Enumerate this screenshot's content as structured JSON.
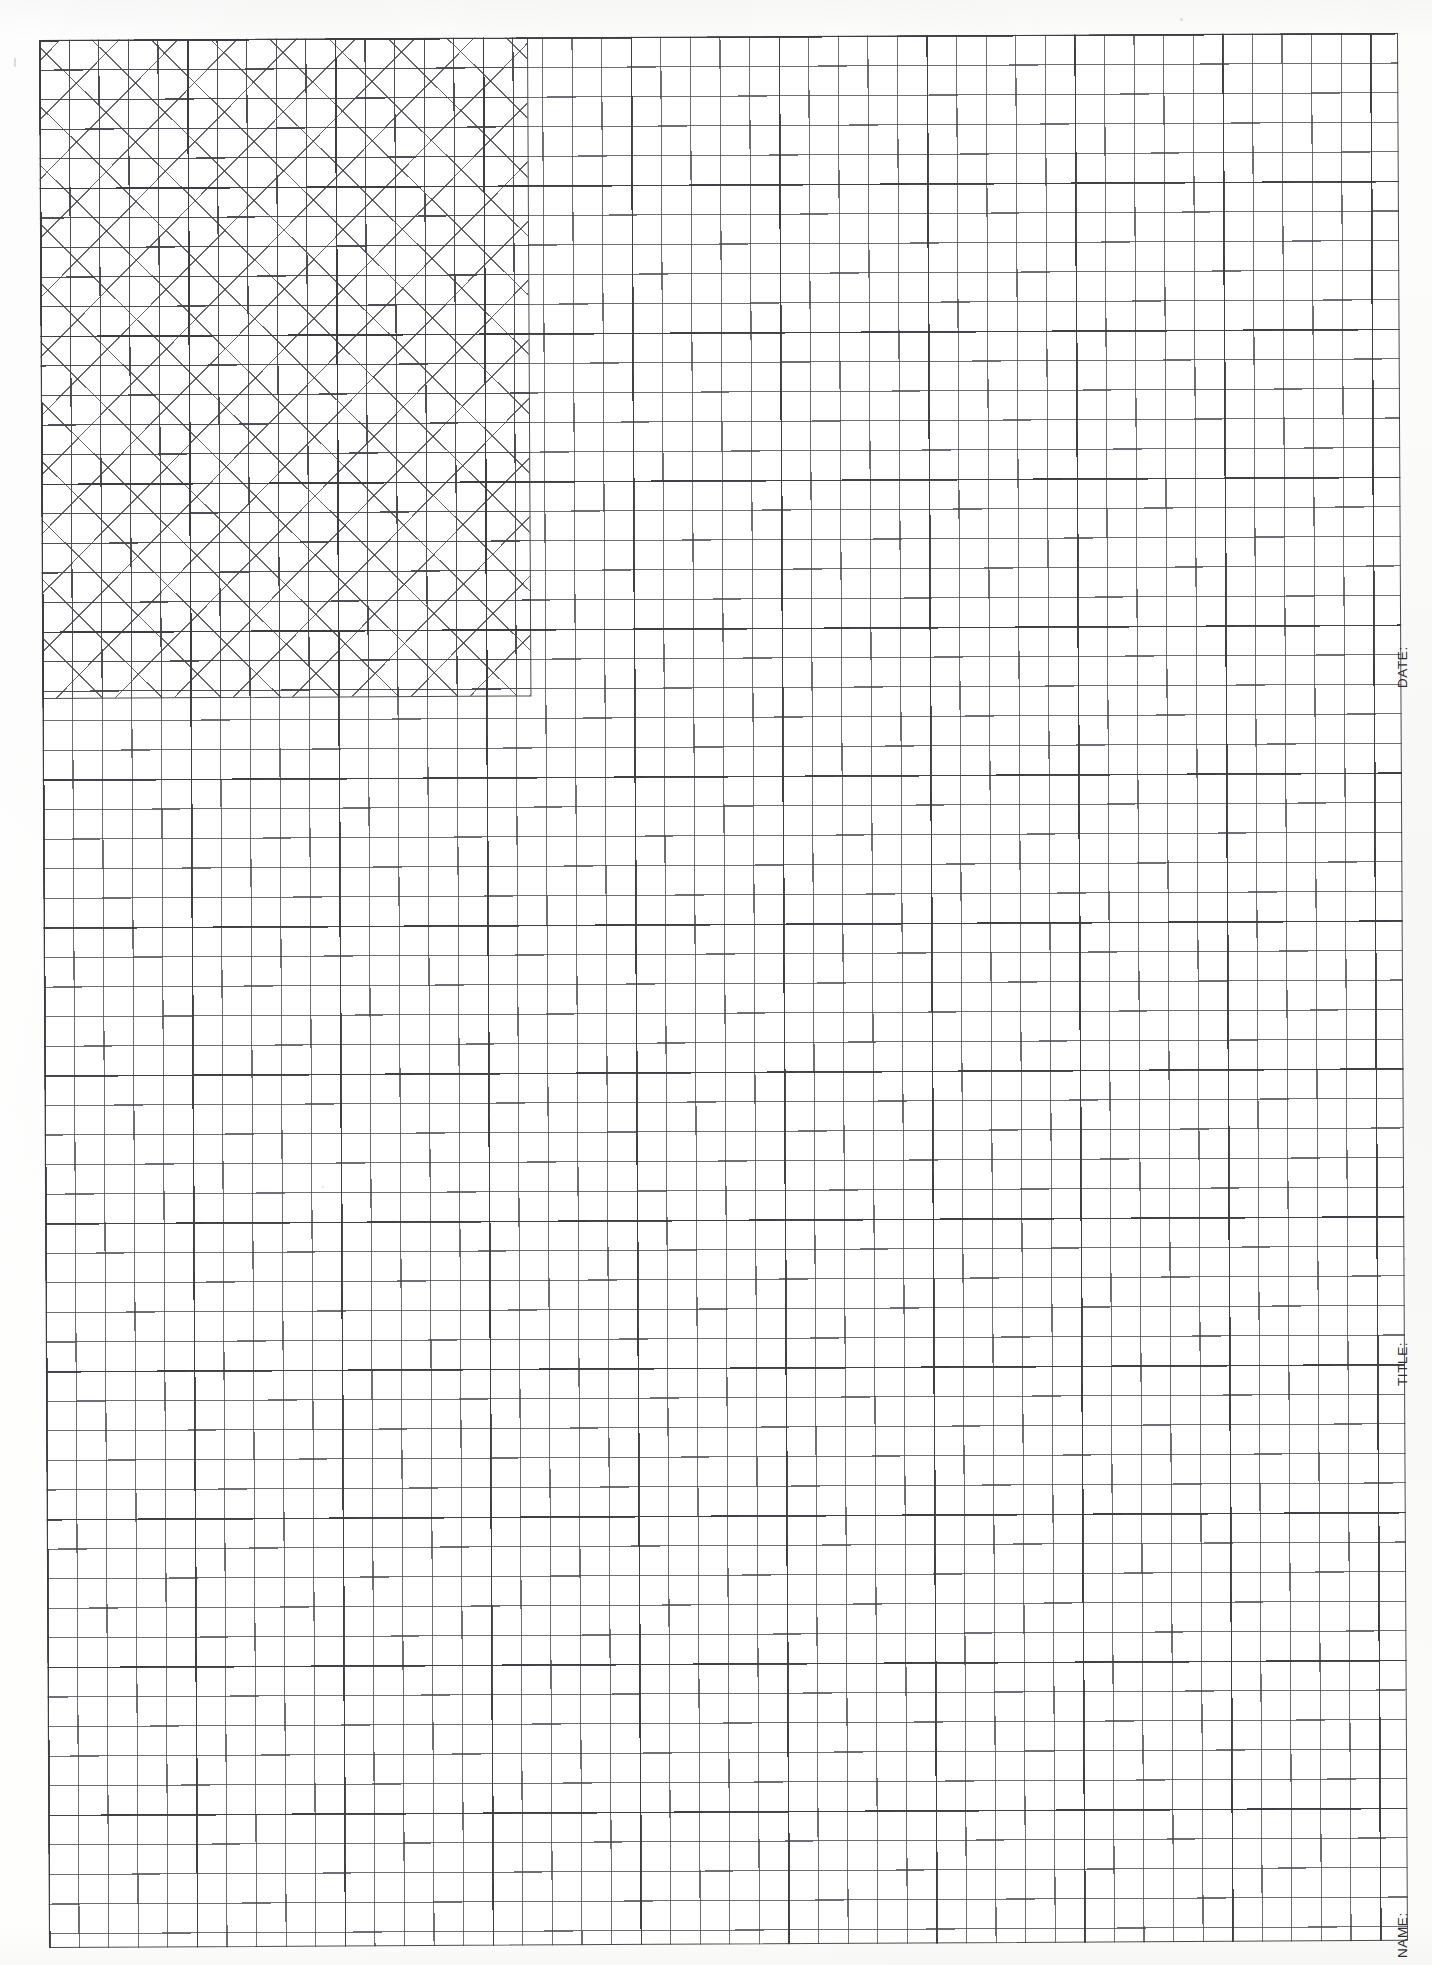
{
  "document": {
    "type": "engineering-graph-paper",
    "orientation": "portrait",
    "background_color": "#fdfdfc",
    "line_color": "#3c3c42",
    "hatch_color": "#3e3e46",
    "page_width": 1432,
    "page_height": 1965
  },
  "grid": {
    "origin_x": 39,
    "origin_y": 40,
    "width": 1359,
    "height": 1908,
    "cell_size_px": 29.58,
    "major_every": 5,
    "columns": 46,
    "rows": 65,
    "minor_line_color": "#46464e",
    "major_line_color": "#3c3c42"
  },
  "hatched_region": {
    "label": "cross-hatched-fill",
    "left": 0,
    "top": 0,
    "width": 488,
    "height": 658,
    "columns": 16,
    "rows": 22,
    "pattern": "cross-hatch-45deg",
    "hatch_spacing_px": 41.83
  },
  "form_fields": [
    {
      "name": "date",
      "label": "DATE:",
      "value": "",
      "orientation": "vertical"
    },
    {
      "name": "title",
      "label": "TITLE:",
      "value": "",
      "orientation": "vertical"
    },
    {
      "name": "name",
      "label": "NAME:",
      "value": "",
      "orientation": "vertical"
    }
  ],
  "chart_data": {
    "type": "heatmap",
    "title": "",
    "subtitle": "",
    "xlabel": "",
    "ylabel": "",
    "grid": true,
    "legend": null,
    "columns": 46,
    "rows": 65,
    "cell_size": 29.58,
    "filled_region": {
      "x_start": 0,
      "x_end": 16,
      "y_start": 0,
      "y_end": 22,
      "fill": "cross-hatch"
    }
  }
}
